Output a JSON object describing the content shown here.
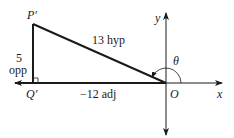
{
  "diagram": {
    "type": "trig-reference-triangle",
    "colors": {
      "stroke": "#1a1a1a",
      "background": "#ffffff"
    },
    "points": {
      "P_prime": {
        "label": "P′",
        "x": 33,
        "y": 24
      },
      "Q_prime": {
        "label": "Q′",
        "x": 33,
        "y": 83
      },
      "O": {
        "label": "O",
        "x": 166,
        "y": 83
      }
    },
    "axes": {
      "x_label": "x",
      "y_label": "y"
    },
    "sides": {
      "hypotenuse": "13 hyp",
      "opposite_value": "5",
      "opposite_word": "opp",
      "adjacent": "−12 adj"
    },
    "angle": {
      "label": "θ"
    }
  }
}
